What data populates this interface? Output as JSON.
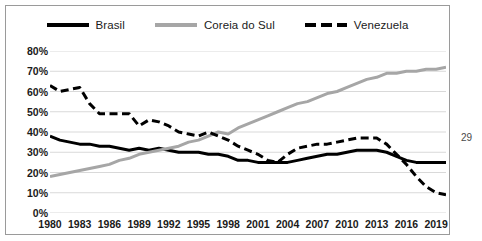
{
  "page_number": "29",
  "legend": {
    "items": [
      {
        "label": "Brasil",
        "style": "solid-black",
        "color": "#000000"
      },
      {
        "label": "Coreia do Sul",
        "style": "solid-gray",
        "color": "#a6a6a6"
      },
      {
        "label": "Venezuela",
        "style": "dashed-black",
        "color": "#000000"
      }
    ]
  },
  "chart_data": {
    "type": "line",
    "title": "",
    "subtitle": "",
    "xlabel": "",
    "ylabel": "",
    "ylim": [
      0,
      80
    ],
    "ytick_step": 10,
    "ytick_labels": [
      "80%",
      "70%",
      "60%",
      "50%",
      "40%",
      "30%",
      "20%",
      "10%",
      "0%"
    ],
    "ytick_values": [
      80,
      70,
      60,
      50,
      40,
      30,
      20,
      10,
      0
    ],
    "grid": true,
    "grid_axis": "y",
    "legend_position": "top",
    "xtick_labels": [
      "1980",
      "1983",
      "1986",
      "1989",
      "1992",
      "1995",
      "1998",
      "2001",
      "2004",
      "2007",
      "2010",
      "2013",
      "2016",
      "2019"
    ],
    "xtick_values": [
      1980,
      1983,
      1986,
      1989,
      1992,
      1995,
      1998,
      2001,
      2004,
      2007,
      2010,
      2013,
      2016,
      2019
    ],
    "xlim": [
      1980,
      2020
    ],
    "x": [
      1980,
      1981,
      1982,
      1983,
      1984,
      1985,
      1986,
      1987,
      1988,
      1989,
      1990,
      1991,
      1992,
      1993,
      1994,
      1995,
      1996,
      1997,
      1998,
      1999,
      2000,
      2001,
      2002,
      2003,
      2004,
      2005,
      2006,
      2007,
      2008,
      2009,
      2010,
      2011,
      2012,
      2013,
      2014,
      2015,
      2016,
      2017,
      2018,
      2019,
      2020
    ],
    "series": [
      {
        "name": "Brasil",
        "color": "#000000",
        "style": "solid",
        "width": 3,
        "values": [
          38,
          36,
          35,
          34,
          34,
          33,
          33,
          32,
          31,
          32,
          31,
          32,
          31,
          30,
          30,
          30,
          29,
          29,
          28,
          26,
          26,
          25,
          25,
          25,
          25,
          26,
          27,
          28,
          29,
          29,
          30,
          31,
          31,
          31,
          30,
          28,
          26,
          25,
          25,
          25,
          25
        ]
      },
      {
        "name": "Coreia do Sul",
        "color": "#a6a6a6",
        "style": "solid",
        "width": 3,
        "values": [
          18,
          19,
          20,
          21,
          22,
          23,
          24,
          26,
          27,
          29,
          30,
          31,
          32,
          33,
          35,
          36,
          38,
          40,
          39,
          42,
          44,
          46,
          48,
          50,
          52,
          54,
          55,
          57,
          59,
          60,
          62,
          64,
          66,
          67,
          69,
          69,
          70,
          70,
          71,
          71,
          72
        ]
      },
      {
        "name": "Venezuela",
        "color": "#000000",
        "style": "dashed",
        "width": 3,
        "values": [
          63,
          60,
          61,
          62,
          54,
          49,
          49,
          49,
          49,
          43,
          46,
          45,
          43,
          40,
          39,
          38,
          40,
          38,
          36,
          33,
          31,
          29,
          26,
          25,
          29,
          32,
          33,
          34,
          34,
          35,
          36,
          37,
          37,
          37,
          34,
          29,
          24,
          18,
          13,
          10,
          9
        ]
      }
    ]
  }
}
